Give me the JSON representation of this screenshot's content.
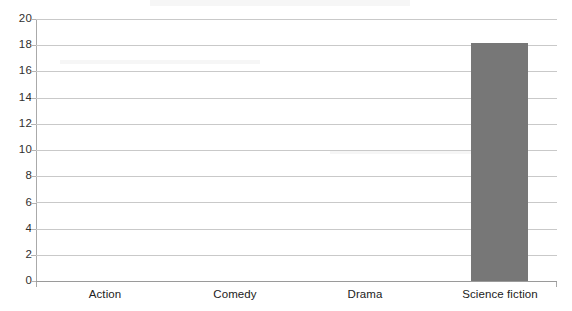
{
  "chart_data": {
    "type": "bar",
    "title": "",
    "subtitle": "",
    "xlabel": "",
    "ylabel": "",
    "categories": [
      "Action",
      "Comedy",
      "Drama",
      "Science fiction"
    ],
    "values": [
      0,
      0,
      0,
      18.2
    ],
    "series": [
      {
        "name": "",
        "values": [
          0,
          0,
          0,
          18.2
        ]
      }
    ],
    "ylim": [
      0,
      20
    ],
    "ytick_labels": [
      "0",
      "2",
      "4",
      "6",
      "8",
      "10",
      "12",
      "14",
      "16",
      "18",
      "20"
    ],
    "ytick_values": [
      0,
      2,
      4,
      6,
      8,
      10,
      12,
      14,
      16,
      18,
      20
    ],
    "grid": true,
    "grid_axis": "y",
    "legend": false,
    "legend_position": "none",
    "annotations": [],
    "colors": {
      "bar": "#777777",
      "gridline": "#c9c9c9",
      "axis": "#aaaaaa",
      "baseline": "#9a9a9a",
      "tick_text": "#2f2f2f",
      "category_text": "#222222",
      "background": "#ffffff"
    }
  }
}
